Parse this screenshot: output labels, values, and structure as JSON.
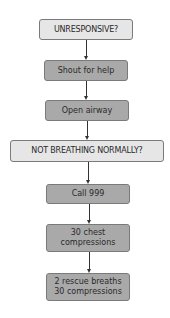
{
  "flowchart": {
    "nodes": [
      {
        "id": "unresponsive",
        "type": "question",
        "label": "UNRESPONSIVE?"
      },
      {
        "id": "shout",
        "type": "action",
        "label": "Shout for help"
      },
      {
        "id": "airway",
        "type": "action",
        "label": "Open airway"
      },
      {
        "id": "not_breathing",
        "type": "question",
        "label": "NOT BREATHING NORMALLY?"
      },
      {
        "id": "call",
        "type": "action",
        "label": "Call 999"
      },
      {
        "id": "chest",
        "type": "action",
        "line1": "30 chest",
        "line2": "compressions"
      },
      {
        "id": "rescue",
        "type": "action",
        "line1": "2 rescue breaths",
        "line2": "30 compressions"
      }
    ],
    "colors": {
      "question_fill": "#e6e6e6",
      "action_fill": "#a9a9a9",
      "border": "#7a7a7a",
      "arrow": "#333333"
    }
  }
}
